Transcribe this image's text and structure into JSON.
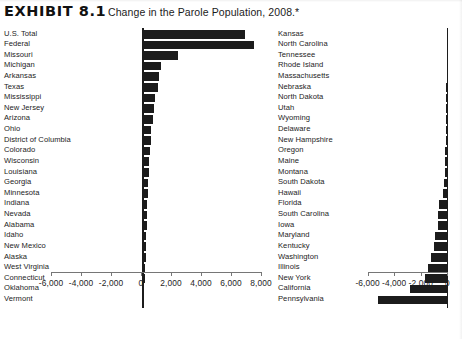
{
  "header": {
    "exhibit_label": "EXHIBIT 8.1",
    "title": "Change in the Parole Population, 2008.*"
  },
  "chart_data": {
    "type": "bar",
    "title": "Change in the Parole Population, 2008.*",
    "orientation": "horizontal",
    "xlabel": "",
    "ylabel": "",
    "grid": false,
    "legend": null,
    "panels": [
      {
        "name": "increases",
        "xlim": [
          -6000,
          8000
        ],
        "xticks": [
          -6000,
          -4000,
          -2000,
          0,
          2000,
          4000,
          6000,
          8000
        ],
        "xtick_labels": [
          "-6,000",
          "-4,000",
          "-2,000",
          "0",
          "2,000",
          "4,000",
          "6,000",
          "8,000"
        ],
        "categories": [
          "U.S. Total",
          "Federal",
          "Missouri",
          "Michigan",
          "Arkansas",
          "Texas",
          "Mississippi",
          "New Jersey",
          "Arizona",
          "Ohio",
          "District of Columbia",
          "Colorado",
          "Wisconsin",
          "Louisiana",
          "Georgia",
          "Minnesota",
          "Indiana",
          "Nevada",
          "Alabama",
          "Idaho",
          "New Mexico",
          "Alaska",
          "West Virginia",
          "Connecticut",
          "Oklahoma",
          "Vermont"
        ],
        "values": [
          6800,
          7400,
          2300,
          1200,
          1050,
          980,
          820,
          700,
          640,
          560,
          520,
          470,
          430,
          400,
          360,
          320,
          290,
          260,
          240,
          220,
          200,
          180,
          150,
          120,
          90,
          60
        ]
      },
      {
        "name": "decreases",
        "xlim": [
          -6800,
          500
        ],
        "xticks": [
          -6000,
          -4000,
          -2000,
          0
        ],
        "xtick_labels": [
          "-6,000",
          "-4,000",
          "-2,000",
          "0"
        ],
        "categories": [
          "Kansas",
          "North Carolina",
          "Tennessee",
          "Rhode Island",
          "Massachusetts",
          "Nebraska",
          "North Dakota",
          "Utah",
          "Wyoming",
          "Delaware",
          "New Hampshire",
          "Oregon",
          "Maine",
          "Montana",
          "South Dakota",
          "Hawaii",
          "Florida",
          "South Carolina",
          "Iowa",
          "Maryland",
          "Kentucky",
          "Washington",
          "Illinois",
          "New York",
          "California",
          "Pennsylvania"
        ],
        "values": [
          -20,
          -30,
          -40,
          -50,
          -60,
          -70,
          -80,
          -90,
          -100,
          -110,
          -130,
          -150,
          -180,
          -210,
          -250,
          -300,
          -640,
          -680,
          -720,
          -900,
          -1000,
          -1200,
          -1450,
          -1700,
          -2800,
          -5200
        ]
      }
    ]
  }
}
